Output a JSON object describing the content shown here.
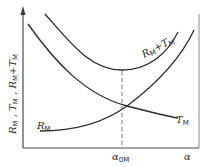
{
  "diagram": {
    "y_axis_label": {
      "parts": [
        {
          "sym": "R",
          "sub": "M"
        },
        {
          "text": " , "
        },
        {
          "sym": "T",
          "sub": "M"
        },
        {
          "text": " , "
        },
        {
          "sym": "R",
          "sub": "M"
        },
        {
          "text": "+"
        },
        {
          "sym": "T",
          "sub": "M"
        }
      ],
      "plain": "R_M , T_M , R_M+T_M"
    },
    "x_axis_label": "α",
    "marker": {
      "sym": "α",
      "sub": "0M",
      "plain": "α_0M",
      "note": "optimum point where R_M+T_M is minimal"
    },
    "curves": [
      {
        "id": "sum",
        "label_sym": "R",
        "label_sub": "M",
        "label_plus": "+",
        "label_sym2": "T",
        "label_sub2": "M",
        "plain": "R_M+T_M",
        "shape": "U-shaped, minimum at α_0M"
      },
      {
        "id": "T",
        "label_sym": "T",
        "label_sub": "M",
        "plain": "T_M",
        "shape": "decreasing"
      },
      {
        "id": "R",
        "label_sym": "R",
        "label_sub": "M",
        "plain": "R_M",
        "shape": "increasing"
      }
    ],
    "colors": {
      "curve": "#2a2a2a",
      "axis": "#4a4a4a",
      "dash": "#6a6a6a"
    }
  }
}
